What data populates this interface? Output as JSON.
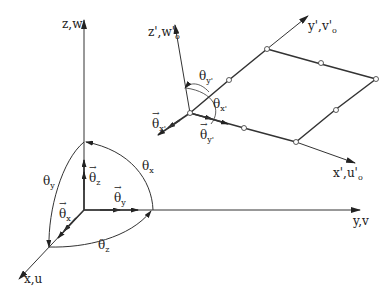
{
  "global_axes": {
    "z_label": "z,w",
    "y_label": "y,v",
    "x_label": "x,u",
    "rotation_vectors": {
      "theta_z": {
        "sym": "θ",
        "sub": "z"
      },
      "theta_y": {
        "sym": "θ",
        "sub": "y"
      },
      "theta_x": {
        "sym": "θ",
        "sub": "x"
      }
    },
    "rotation_arcs": {
      "theta_x": {
        "sym": "θ",
        "sub": "x"
      },
      "theta_y": {
        "sym": "θ",
        "sub": "y"
      },
      "theta_z": {
        "sym": "θ",
        "sub": "z"
      }
    }
  },
  "local_axes": {
    "z_label": "z',w'",
    "z_sub": "o",
    "y_label": "y',v'",
    "y_sub": "o",
    "x_label": "x',u'",
    "x_sub": "o",
    "rotation_vectors": {
      "theta_x": {
        "sym": "θ",
        "sub": "x'"
      },
      "theta_y": {
        "sym": "θ",
        "sub": "y'"
      }
    },
    "rotation_arcs": {
      "theta_y": {
        "sym": "θ",
        "sub": "y'"
      },
      "theta_x": {
        "sym": "θ",
        "sub": "x'"
      }
    }
  },
  "element": {
    "type": "8-node quadrilateral shell element",
    "node_count": 8
  }
}
